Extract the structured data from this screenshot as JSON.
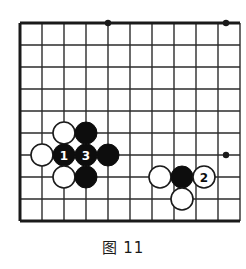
{
  "figure": {
    "caption": "图 11",
    "caption_label": "图",
    "caption_number": "11"
  },
  "board": {
    "type": "go-board-diagram",
    "columns": 10,
    "rows": 10,
    "cell_size": 22,
    "origin_x": 20,
    "origin_y": 23,
    "stone_radius": 11,
    "line_color": "#2b2b2b",
    "border_color": "#1a1a1a",
    "black_color": "#0d0d0d",
    "white_color": "#ffffff",
    "background_color": "#ffffff",
    "thick_edges": [
      "left",
      "top",
      "bottom"
    ],
    "star_points": [
      {
        "name": "star-point-top",
        "cx": 108,
        "cy": 23
      },
      {
        "name": "star-point-top-right",
        "cx": 226,
        "cy": 23
      },
      {
        "name": "star-point-right",
        "cx": 226,
        "cy": 155
      }
    ],
    "v_lines": [
      20,
      42,
      64,
      86,
      108,
      130,
      152,
      174,
      196,
      204,
      226
    ],
    "h_lines": [
      23,
      45,
      67,
      89,
      111,
      133,
      155,
      177,
      199,
      221
    ]
  },
  "stones": [
    {
      "name": "white-stone-1",
      "color": "white",
      "cx": 64,
      "cy": 133,
      "label": ""
    },
    {
      "name": "black-stone-1",
      "color": "black",
      "cx": 86,
      "cy": 133,
      "label": ""
    },
    {
      "name": "white-stone-2",
      "color": "white",
      "cx": 42,
      "cy": 155,
      "label": ""
    },
    {
      "name": "black-move-1",
      "color": "black",
      "cx": 64,
      "cy": 155,
      "label": "1"
    },
    {
      "name": "black-move-3",
      "color": "black",
      "cx": 86,
      "cy": 155,
      "label": "3"
    },
    {
      "name": "black-stone-2",
      "color": "black",
      "cx": 108,
      "cy": 155,
      "label": ""
    },
    {
      "name": "white-stone-3",
      "color": "white",
      "cx": 64,
      "cy": 177,
      "label": ""
    },
    {
      "name": "black-stone-3",
      "color": "black",
      "cx": 86,
      "cy": 177,
      "label": ""
    },
    {
      "name": "white-stone-4",
      "color": "white",
      "cx": 160,
      "cy": 177,
      "label": ""
    },
    {
      "name": "black-stone-4",
      "color": "black",
      "cx": 182,
      "cy": 177,
      "label": ""
    },
    {
      "name": "white-move-2",
      "color": "white",
      "cx": 204,
      "cy": 177,
      "label": "2"
    },
    {
      "name": "white-stone-5",
      "color": "white",
      "cx": 182,
      "cy": 199,
      "label": ""
    }
  ]
}
